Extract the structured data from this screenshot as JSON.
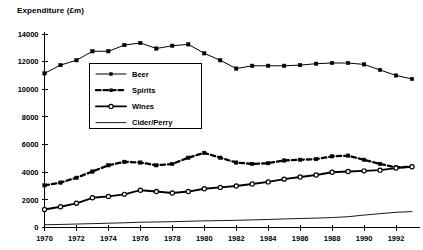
{
  "chart_data": {
    "type": "line",
    "title": "Expenditure (£m)",
    "xlabel": "",
    "ylabel": "",
    "ylim": [
      0,
      14000
    ],
    "xlim": [
      1970,
      1993
    ],
    "ytick_step": 2000,
    "xtick_step": 2,
    "grid": false,
    "legend_position": "upper-center-left",
    "yticks": [
      "0",
      "2000",
      "4000",
      "6000",
      "8000",
      "10000",
      "12000",
      "14000"
    ],
    "ytick_values": [
      0,
      2000,
      4000,
      6000,
      8000,
      10000,
      12000,
      14000
    ],
    "xticks": [
      "1970",
      "1972",
      "1974",
      "1976",
      "1978",
      "1980",
      "1982",
      "1984",
      "1986",
      "1988",
      "1990",
      "1992"
    ],
    "xtick_values": [
      1970,
      1972,
      1974,
      1976,
      1978,
      1980,
      1982,
      1984,
      1986,
      1988,
      1990,
      1992
    ],
    "x": [
      1970,
      1971,
      1972,
      1973,
      1974,
      1975,
      1976,
      1977,
      1978,
      1979,
      1980,
      1981,
      1982,
      1983,
      1984,
      1985,
      1986,
      1987,
      1988,
      1989,
      1990,
      1991,
      1992,
      1993
    ],
    "series": [
      {
        "name": "Beer",
        "marker": "filled-square",
        "line": "solid",
        "color": "#000000",
        "values": [
          11150,
          11750,
          12100,
          12750,
          12750,
          13200,
          13350,
          12950,
          13150,
          13250,
          12600,
          12100,
          11500,
          11700,
          11700,
          11700,
          11750,
          11850,
          11900,
          11900,
          11800,
          11400,
          11000,
          10750
        ]
      },
      {
        "name": "Spirits",
        "marker": "filled-square",
        "line": "dashed",
        "color": "#000000",
        "values": [
          3050,
          3250,
          3600,
          4050,
          4500,
          4750,
          4700,
          4500,
          4600,
          5050,
          5400,
          5050,
          4700,
          4600,
          4650,
          4850,
          4900,
          4950,
          5150,
          5200,
          4900,
          4600,
          4350,
          4400
        ]
      },
      {
        "name": "Wines",
        "marker": "open-circle",
        "line": "solid-thick",
        "color": "#000000",
        "values": [
          1300,
          1500,
          1750,
          2150,
          2250,
          2400,
          2700,
          2600,
          2500,
          2600,
          2800,
          2900,
          3000,
          3150,
          3300,
          3500,
          3650,
          3800,
          4000,
          4050,
          4100,
          4150,
          4300,
          4400
        ]
      },
      {
        "name": "Cider/Perry",
        "marker": "none",
        "line": "thin",
        "color": "#000000",
        "values": [
          200,
          220,
          250,
          280,
          310,
          340,
          380,
          400,
          420,
          450,
          480,
          500,
          520,
          550,
          580,
          620,
          650,
          680,
          720,
          780,
          900,
          1000,
          1100,
          1150
        ]
      }
    ]
  },
  "legend": {
    "items": [
      {
        "label": "Beer"
      },
      {
        "label": "Spirits"
      },
      {
        "label": "Wines"
      },
      {
        "label": "Cider/Perry"
      }
    ]
  }
}
